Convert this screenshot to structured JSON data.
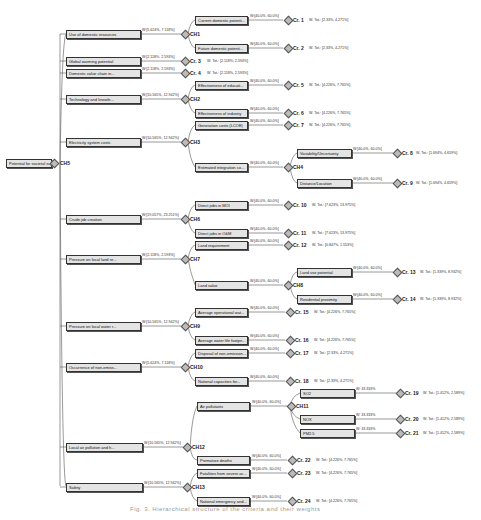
{
  "root": {
    "label": "Potential for societal sup...",
    "ch": "CH5"
  },
  "level1": [
    {
      "label": "Use of domestic resources",
      "weight": "W:[5.624%, 7.118%]",
      "target": "CH1"
    },
    {
      "label": "Global warming potential",
      "weight": "W:[2.118%, 2.593%]",
      "target": "Cr. 3",
      "total": "W. Tot.: [2.118%, 2.593%]"
    },
    {
      "label": "Domestic value chain in...",
      "weight": "W:[2.118%, 2.593%]",
      "target": "Cr. 4",
      "total": "W. Tot.: [2.118%, 2.593%]"
    },
    {
      "label": "Technology and knowle...",
      "weight": "W:[10.565%, 12.942%]",
      "target": "CH2"
    },
    {
      "label": "Electricity system costs",
      "weight": "W:[10.565%, 12.942%]",
      "target": "CH3"
    },
    {
      "label": "Crude job creation",
      "weight": "W:[19.057%, 23.251%]",
      "target": "CH6"
    },
    {
      "label": "Pressure on local land re...",
      "weight": "W:[2.118%, 2.593%]",
      "target": "CH7"
    },
    {
      "label": "Pressure on local water r...",
      "weight": "W:[10.565%, 12.942%]",
      "target": "CH9"
    },
    {
      "label": "Occurrence of non-emiss...",
      "weight": "W:[5.624%, 7.118%]",
      "target": "CH10"
    },
    {
      "label": "Local air pollution and h...",
      "weight": "W:[10.565%, 12.942%]",
      "target": "CH12"
    },
    {
      "label": "Safety",
      "weight": "W:[10.565%, 12.942%]",
      "target": "CH13"
    }
  ],
  "level2": [
    {
      "label": "Current domestic potenti...",
      "weight": "W:[40.0%, 60.0%]",
      "target": "Cr. 1",
      "total": "W. Tot.: [2.33%, 4.271%]"
    },
    {
      "label": "Future domestic potenti...",
      "weight": "W:[40.0%, 60.0%]",
      "target": "Cr. 2",
      "total": "W. Tot.: [2.33%, 4.271%]"
    },
    {
      "label": "Effectiveness of educati...",
      "weight": "W:[40.0%, 60.0%]",
      "target": "Cr. 5",
      "total": "W. Tot.: [4.226%, 7.765%]"
    },
    {
      "label": "Effectiveness of industry",
      "weight": "W:[40.0%, 60.0%]",
      "target": "Cr. 6",
      "total": "W. Tot.: [4.226%, 7.765%]"
    },
    {
      "label": "Generation costs (LCOE)",
      "weight": "W:[40.0%, 60.0%]",
      "target": "Cr. 7",
      "total": "W. Tot.: [4.226%, 7.765%]"
    },
    {
      "label": "Estimated integration co...",
      "weight": "W:[40.0%, 60.0%]",
      "target": "CH4"
    },
    {
      "label": "Direct jobs in MOI",
      "weight": "W:[40.0%, 60.0%]",
      "target": "Cr. 10",
      "total": "W. Tot.: [7.623%, 13.975%]"
    },
    {
      "label": "Direct jobs in O&M",
      "weight": "W:[40.0%, 60.0%]",
      "target": "Cr. 11",
      "total": "W. Tot.: [7.623%, 13.975%]"
    },
    {
      "label": "Land requirement",
      "weight": "W:[40.0%, 60.0%]",
      "target": "Cr. 12",
      "total": "W. Tot.: [0.847%, 1.553%]"
    },
    {
      "label": "Land value",
      "weight": "W:[40.0%, 60.0%]",
      "target": "CH8"
    },
    {
      "label": "Average operational wat...",
      "weight": "W:[40.0%, 60.0%]",
      "target": "Cr. 15",
      "total": "W. Tot.: [4.226%, 7.765%]"
    },
    {
      "label": "Average water life footpri...",
      "weight": "W:[40.0%, 60.0%]",
      "target": "Cr. 16",
      "total": "W. Tot.: [4.226%, 7.765%]"
    },
    {
      "label": "Disposal of non-emission...",
      "weight": "W:[40.0%, 60.0%]",
      "target": "Cr. 17",
      "total": "W. Tot.: [2.33%, 4.271%]"
    },
    {
      "label": "National capacities for...",
      "weight": "W:[40.0%, 60.0%]",
      "target": "Cr. 18",
      "total": "W. Tot.: [2.33%, 4.271%]"
    },
    {
      "label": "Air pollutants",
      "weight": "W:[40.0%, 60.0%]",
      "target": "CH11"
    },
    {
      "label": "Premature deaths",
      "weight": "W:[40.0%, 60.0%]",
      "target": "Cr. 22",
      "total": "W. Tot.: [4.226%, 7.765%]"
    },
    {
      "label": "Fatalities from severe ac...",
      "weight": "W:[40.0%, 60.0%]",
      "target": "Cr. 23",
      "total": "W. Tot.: [4.226%, 7.765%]"
    },
    {
      "label": "National emergency and...",
      "weight": "W:[40.0%, 60.0%]",
      "target": "Cr. 24",
      "total": "W. Tot.: [4.226%, 7.765%]"
    }
  ],
  "level3": [
    {
      "label": "Variability/Uncertainty",
      "weight": "W:[40.0%, 60.0%]",
      "target": "Cr. 8",
      "total": "W. Tot.: [1.694%, 4.659%]"
    },
    {
      "label": "Distance/Location",
      "weight": "W:[40.0%, 60.0%]",
      "target": "Cr. 9",
      "total": "W. Tot.: [1.694%, 4.659%]"
    },
    {
      "label": "Land use potential",
      "weight": "W:[40.0%, 60.0%]",
      "target": "Cr. 13",
      "total": "W. Tot.: [1.339%, 8.932%]"
    },
    {
      "label": "Residential proximity",
      "weight": "W:[40.0%, 60.0%]",
      "target": "Cr. 14",
      "total": "W. Tot.: [1.339%, 8.932%]"
    },
    {
      "label": "SO2",
      "weight": "W: 33.333%",
      "target": "Cr. 19",
      "total": "W. Tot.: [1.412%, 2.589%]"
    },
    {
      "label": "NOX",
      "weight": "W: 33.333%",
      "target": "Cr. 20",
      "total": "W. Tot.: [1.412%, 2.589%]"
    },
    {
      "label": "PM2.5",
      "weight": "W: 33.333%",
      "target": "Cr. 21",
      "total": "W. Tot.: [1.412%, 2.589%]"
    }
  ],
  "caption": "Fig. 3. Hierarchical structure of the criteria and their weights"
}
